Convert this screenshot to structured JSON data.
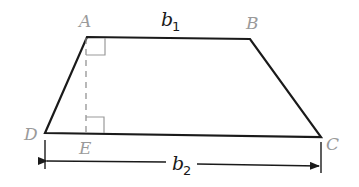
{
  "diagram": {
    "vertices": {
      "A": {
        "label": "A",
        "x": 87,
        "y": 37
      },
      "B": {
        "label": "B",
        "x": 250,
        "y": 39
      },
      "C": {
        "label": "C",
        "x": 321,
        "y": 137
      },
      "D": {
        "label": "D",
        "x": 45,
        "y": 133
      },
      "E": {
        "label": "E",
        "x": 86,
        "y": 134
      }
    },
    "labels": {
      "A": "A",
      "B": "B",
      "C": "C",
      "D": "D",
      "E": "E",
      "b1_main": "b",
      "b1_sub": "1",
      "b2_main": "b",
      "b2_sub": "2"
    },
    "colors": {
      "edge": "#1a1a1a",
      "vertex_label": "#9a9a9a",
      "altitude": "#8a8a8a",
      "right_angle_mark": "#9a9a9a"
    },
    "elements": [
      "trapezoid outline ABCD",
      "dashed altitude from A to E",
      "right-angle mark at A",
      "right-angle mark at E",
      "dimension arrow for b2 below base DC"
    ]
  }
}
